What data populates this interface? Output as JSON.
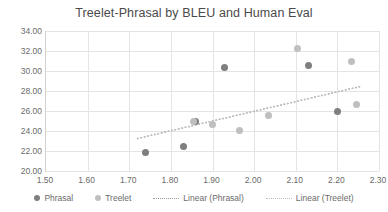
{
  "chart_data": {
    "type": "scatter",
    "title": "Treelet-Phrasal by BLEU and Human Eval",
    "xlabel": "",
    "ylabel": "",
    "xlim": [
      1.5,
      2.3
    ],
    "ylim": [
      20.0,
      34.0
    ],
    "xticks": [
      "1.50",
      "1.60",
      "1.70",
      "1.80",
      "1.90",
      "2.00",
      "2.10",
      "2.20",
      "2.30"
    ],
    "xtick_values": [
      1.5,
      1.6,
      1.7,
      1.8,
      1.9,
      2.0,
      2.1,
      2.2,
      2.3
    ],
    "yticks": [
      "20.00",
      "22.00",
      "24.00",
      "26.00",
      "28.00",
      "30.00",
      "32.00",
      "34.00"
    ],
    "ytick_values": [
      20.0,
      22.0,
      24.0,
      26.0,
      28.0,
      30.0,
      32.0,
      34.0
    ],
    "grid": true,
    "legend_position": "bottom",
    "series": [
      {
        "name": "Phrasal",
        "color": "#7f7f7f",
        "marker": "circle",
        "points": [
          {
            "x": 1.74,
            "y": 21.9
          },
          {
            "x": 1.83,
            "y": 22.45
          },
          {
            "x": 1.86,
            "y": 24.95
          },
          {
            "x": 1.93,
            "y": 30.4
          },
          {
            "x": 2.13,
            "y": 30.6
          },
          {
            "x": 2.2,
            "y": 26.0
          }
        ]
      },
      {
        "name": "Treelet",
        "color": "#bfbfbf",
        "marker": "circle",
        "points": [
          {
            "x": 1.855,
            "y": 25.0
          },
          {
            "x": 1.9,
            "y": 24.7
          },
          {
            "x": 1.965,
            "y": 24.1
          },
          {
            "x": 2.035,
            "y": 25.6
          },
          {
            "x": 2.105,
            "y": 32.3
          },
          {
            "x": 2.235,
            "y": 31.0
          },
          {
            "x": 2.245,
            "y": 26.7
          }
        ]
      }
    ],
    "trendlines": [
      {
        "name": "Linear (Phrasal)",
        "color": "#9a9a9a",
        "style": "dotted",
        "x_start": 1.72,
        "y_start": 23.25,
        "x_end": 2.255,
        "y_end": 28.45
      },
      {
        "name": "Linear (Treelet)",
        "color": "#c0c0c0",
        "style": "dotted",
        "x_start": 1.72,
        "y_start": 23.25,
        "x_end": 2.255,
        "y_end": 28.45
      }
    ],
    "legend": [
      {
        "label": "Phrasal",
        "type": "marker",
        "color": "#7f7f7f"
      },
      {
        "label": "Treelet",
        "type": "marker",
        "color": "#bfbfbf"
      },
      {
        "label": "Linear (Phrasal)",
        "type": "line",
        "color": "#9a9a9a"
      },
      {
        "label": "Linear (Treelet)",
        "type": "line",
        "color": "#c0c0c0"
      }
    ]
  }
}
